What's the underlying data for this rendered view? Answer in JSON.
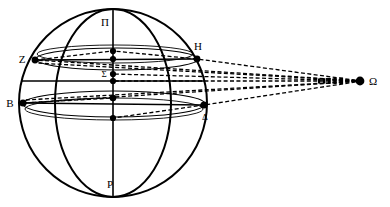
{
  "figure": {
    "background_color": "#ffffff",
    "stroke_color": "#000000",
    "width": 390,
    "height": 207
  },
  "labels": {
    "north_pole": "Π",
    "south_pole": "P",
    "center": "Σ",
    "upper_left": "Z",
    "upper_right": "H",
    "lower_left": "B",
    "lower_right": "Δ",
    "observer": "Ω"
  },
  "points": [
    {
      "id": "north-pole",
      "label": "Π",
      "x": 113,
      "y": 18,
      "label_x": 105,
      "label_y": 26,
      "dot": false
    },
    {
      "id": "south-pole",
      "label": "P",
      "x": 113,
      "y": 190,
      "label_x": 110,
      "label_y": 186,
      "dot": false
    },
    {
      "id": "center-sigma",
      "label": "Σ",
      "x": 113,
      "y": 81,
      "label_x": 104,
      "label_y": 77,
      "dot": true
    },
    {
      "id": "point-z",
      "label": "Z",
      "x": 35,
      "y": 60,
      "label_x": 22,
      "label_y": 62,
      "dot": true
    },
    {
      "id": "point-h",
      "label": "H",
      "x": 197,
      "y": 59,
      "label_x": 196,
      "label_y": 51,
      "dot": true
    },
    {
      "id": "point-b",
      "label": "B",
      "x": 23,
      "y": 103,
      "label_x": 9,
      "label_y": 107,
      "dot": true
    },
    {
      "id": "point-delta",
      "label": "Δ",
      "x": 204,
      "y": 105,
      "label_x": 202,
      "label_y": 119,
      "dot": true
    },
    {
      "id": "observer-omega",
      "label": "Ω",
      "x": 362,
      "y": 81,
      "label_x": 371,
      "label_y": 85,
      "dot": true
    }
  ],
  "axis_nodes": [
    {
      "id": "axis-node-1",
      "x": 113,
      "y": 51
    },
    {
      "id": "axis-node-2",
      "x": 113,
      "y": 59
    },
    {
      "id": "axis-node-3",
      "x": 113,
      "y": 74
    },
    {
      "id": "axis-node-4",
      "x": 113,
      "y": 81
    },
    {
      "id": "axis-node-5",
      "x": 113,
      "y": 98
    },
    {
      "id": "axis-node-6",
      "x": 113,
      "y": 118
    }
  ],
  "sphere": {
    "outer_circle": {
      "cx": 113,
      "cy": 103,
      "r": 94
    },
    "meridian_ellipse": {
      "cx": 113,
      "cy": 103,
      "rx": 58,
      "ry": 94
    }
  },
  "latitude_circles": [
    {
      "id": "circle-zh",
      "cx": 117,
      "cy": 59,
      "rx": 82,
      "ry": 11
    },
    {
      "id": "circle-upper",
      "cx": 115,
      "cy": 54,
      "rx": 78,
      "ry": 9
    },
    {
      "id": "circle-bd",
      "cx": 114,
      "cy": 104,
      "rx": 91,
      "ry": 13
    },
    {
      "id": "circle-lower",
      "cx": 114,
      "cy": 109,
      "rx": 89,
      "ry": 11
    }
  ],
  "sight_lines": [
    {
      "id": "ray-omega-z",
      "from": "observer-omega",
      "to": "point-z",
      "style": "dashed"
    },
    {
      "id": "ray-omega-h",
      "from": "observer-omega",
      "to": "point-h",
      "style": "dashed"
    },
    {
      "id": "ray-omega-b",
      "from": "observer-omega",
      "to": "point-b",
      "style": "dashed"
    },
    {
      "id": "ray-omega-delta",
      "from": "observer-omega",
      "to": "point-delta",
      "style": "dashed"
    },
    {
      "id": "ray-omega-sigma",
      "from": "observer-omega",
      "to": "center-sigma",
      "style": "dashed"
    }
  ],
  "colors": {
    "ink": "#000000",
    "paper": "#ffffff"
  }
}
